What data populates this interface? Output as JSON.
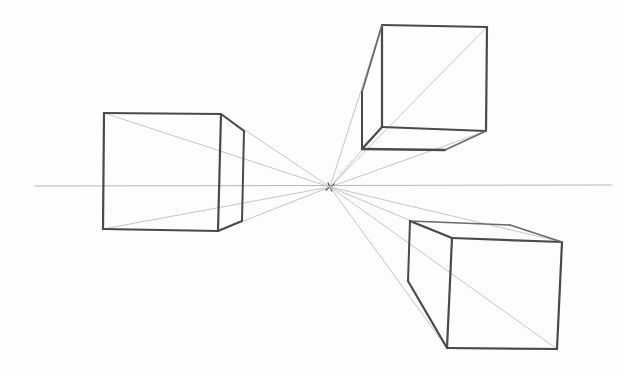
{
  "image": {
    "subject": "One-point perspective pencil sketch",
    "width": 624,
    "height": 375,
    "colors": {
      "background": "#fdfdfd",
      "heavy_stroke": "#4a4a4a",
      "medium_stroke": "#6a6a6a",
      "guide_line": "#b8b8b8"
    },
    "horizon_line": {
      "x1": 35,
      "y1": 186,
      "x2": 612,
      "y2": 185
    },
    "vanishing_point": {
      "x": 330,
      "y": 187
    },
    "cubes": [
      {
        "name": "left-cube",
        "front": [
          [
            104,
            113
          ],
          [
            221,
            114
          ],
          [
            218,
            231
          ],
          [
            103,
            229
          ]
        ],
        "back_top": [
          244,
          131
        ],
        "back_bottom": [
          242,
          221
        ]
      },
      {
        "name": "top-right-cube",
        "front": [
          [
            382,
            25
          ],
          [
            487,
            27
          ],
          [
            486,
            131
          ],
          [
            382,
            127
          ]
        ],
        "back_top": [
          362,
          92
        ],
        "back_bottom_left": [
          362,
          149
        ],
        "back_bottom_right": [
          445,
          150
        ]
      },
      {
        "name": "bottom-right-cube",
        "front": [
          [
            452,
            238
          ],
          [
            562,
            242
          ],
          [
            557,
            349
          ],
          [
            447,
            348
          ]
        ],
        "back_top": [
          410,
          221
        ],
        "back_bottom": [
          408,
          281
        ]
      }
    ]
  }
}
